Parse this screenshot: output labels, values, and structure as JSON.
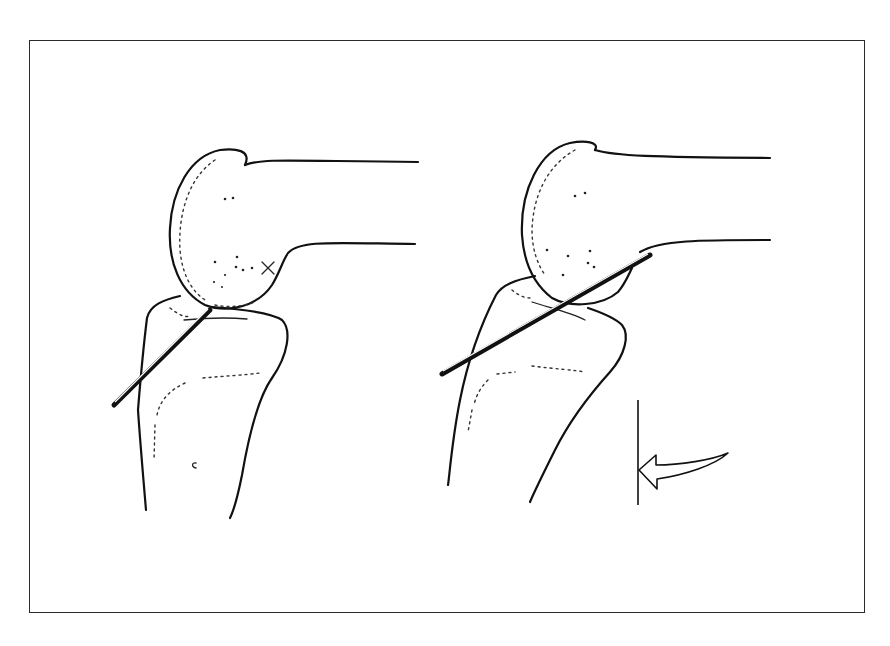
{
  "figure": {
    "type": "anatomical-line-drawing",
    "panels": [
      {
        "id": "left",
        "subject": "knee joint (femoral condyle over tibial plateau)",
        "elements": [
          "femur",
          "tibia",
          "instrument-rod",
          "x-mark"
        ]
      },
      {
        "id": "right",
        "subject": "knee joint with instrument passing through joint space",
        "elements": [
          "femur",
          "tibia",
          "instrument-rod",
          "reference-line",
          "curved-arrow"
        ]
      }
    ],
    "colors": {
      "line": "#111111",
      "background": "#ffffff",
      "frame": "#2a2a2a"
    }
  }
}
